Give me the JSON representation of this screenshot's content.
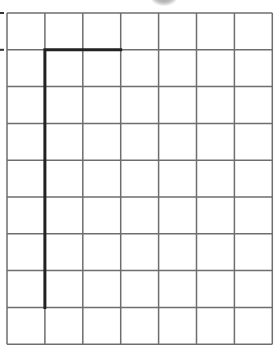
{
  "diagram": {
    "type": "grid-with-path",
    "grid": {
      "columns": 7,
      "rows": 9,
      "left": 7,
      "top": 13,
      "cell_width": 37.9,
      "cell_height": 36.8,
      "line_color": "#6e6e6e",
      "line_width": 1.5
    },
    "tick_marks": [
      {
        "y_row": 0
      },
      {
        "y_row": 1
      }
    ],
    "path": {
      "color": "#222222",
      "width": 3,
      "points_grid": [
        [
          3,
          1
        ],
        [
          1,
          1
        ],
        [
          1,
          8
        ]
      ]
    },
    "shadow_blob": {
      "x": 164,
      "y": 0,
      "color": "#9a9a9a"
    }
  }
}
